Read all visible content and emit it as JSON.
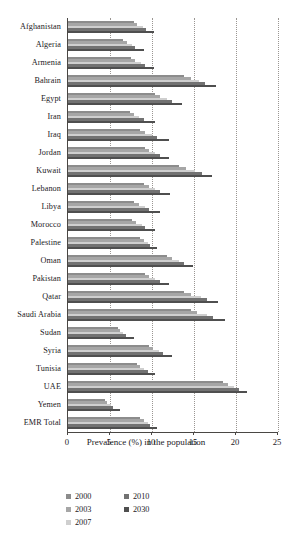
{
  "chart_data": {
    "type": "bar",
    "orientation": "horizontal",
    "title": "",
    "subtitle": "",
    "xlabel": "Prevalence (%) in the population",
    "ylabel": "",
    "xlim": [
      0,
      25
    ],
    "xticks": [
      0,
      5,
      10,
      15,
      20,
      25
    ],
    "xtick_labels": [
      "0",
      "5",
      "10",
      "15",
      "20",
      "25"
    ],
    "grid": "vertical-dotted",
    "legend_position": "bottom-left",
    "categories": [
      "Afghanistan",
      "Algeria",
      "Armenia",
      "Bahrain",
      "Egypt",
      "Iran",
      "Iraq",
      "Jordan",
      "Kuwait",
      "Lebanon",
      "Libya",
      "Morocco",
      "Palestine",
      "Oman",
      "Pakistan",
      "Qatar",
      "Saudi Arabia",
      "Sudan",
      "Syria",
      "Tunisia",
      "UAE",
      "Yemen",
      "EMR Total"
    ],
    "series": [
      {
        "name": "2000",
        "color": "#8c8c8c",
        "values": [
          7.8,
          6.6,
          7.5,
          13.8,
          10.4,
          7.4,
          8.6,
          9.2,
          13.2,
          9.0,
          7.9,
          7.6,
          8.6,
          11.8,
          9.2,
          13.8,
          14.6,
          5.9,
          9.6,
          8.2,
          18.4,
          4.4,
          8.6
        ]
      },
      {
        "name": "2003",
        "color": "#a6a6a6",
        "values": [
          8.2,
          7.0,
          8.0,
          14.6,
          11.0,
          7.9,
          9.2,
          9.7,
          14.0,
          9.6,
          8.5,
          8.1,
          9.0,
          12.4,
          9.7,
          14.7,
          15.4,
          6.2,
          10.1,
          8.6,
          19.0,
          4.7,
          9.0
        ]
      },
      {
        "name": "2007",
        "color": "#cfcfcf",
        "values": [
          8.9,
          7.6,
          8.7,
          15.6,
          11.8,
          8.5,
          10.0,
          10.4,
          15.1,
          10.4,
          9.2,
          8.8,
          9.5,
          13.2,
          10.4,
          15.8,
          16.5,
          6.6,
          10.8,
          9.1,
          19.8,
          5.1,
          9.5
        ]
      },
      {
        "name": "2010",
        "color": "#727272",
        "values": [
          9.3,
          8.0,
          9.2,
          16.3,
          12.4,
          9.0,
          10.6,
          10.9,
          15.9,
          11.0,
          9.7,
          9.2,
          9.8,
          13.8,
          10.9,
          16.6,
          17.3,
          6.9,
          11.3,
          9.5,
          20.3,
          5.4,
          9.8
        ]
      },
      {
        "name": "2030",
        "color": "#4f4f4f",
        "values": [
          10.2,
          9.0,
          10.2,
          17.6,
          13.6,
          10.3,
          12.0,
          12.0,
          17.2,
          12.2,
          11.0,
          10.4,
          10.6,
          14.9,
          12.0,
          17.9,
          18.7,
          7.8,
          12.4,
          10.4,
          21.3,
          6.2,
          10.6
        ]
      }
    ]
  },
  "legend": {
    "items": [
      {
        "label": "2000",
        "color": "#8c8c8c"
      },
      {
        "label": "2003",
        "color": "#a6a6a6"
      },
      {
        "label": "2007",
        "color": "#cfcfcf"
      },
      {
        "label": "2010",
        "color": "#727272"
      },
      {
        "label": "2030",
        "color": "#4f4f4f"
      }
    ]
  }
}
